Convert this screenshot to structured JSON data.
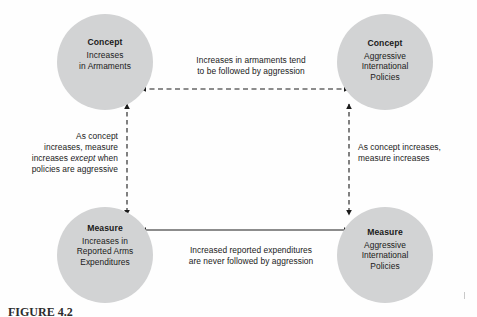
{
  "figure": {
    "caption": "FIGURE 4.2",
    "background_color": "#fefefe",
    "node_fill_color": "#d2d3d4",
    "line_color": "#1a1a1a"
  },
  "nodes": [
    {
      "id": "top-left",
      "title": "Concept",
      "lines": [
        "Increases",
        "in Armaments"
      ]
    },
    {
      "id": "top-right",
      "title": "Concept",
      "lines": [
        "Aggressive",
        "International",
        "Policies"
      ]
    },
    {
      "id": "bottom-left",
      "title": "Measure",
      "lines": [
        "Increases in",
        "Reported Arms",
        "Expenditures"
      ]
    },
    {
      "id": "bottom-right",
      "title": "Measure",
      "lines": [
        "Aggressive",
        "International",
        "Policies"
      ]
    }
  ],
  "edges": [
    {
      "id": "top-edge",
      "style": "dashed",
      "arrowheads": "both",
      "orientation": "horizontal",
      "lines": [
        "Increases in armaments tend",
        "to be followed by aggression"
      ]
    },
    {
      "id": "bottom-edge",
      "style": "solid",
      "arrowheads": "both",
      "orientation": "horizontal",
      "lines": [
        "Increased reported expenditures",
        "are never followed by aggression"
      ]
    },
    {
      "id": "left-edge",
      "style": "dashed",
      "arrowheads": "both",
      "orientation": "vertical",
      "lines": [
        "As concept",
        "increases, measure",
        "increases except when",
        "policies are aggressive"
      ],
      "emphasis_word": "except"
    },
    {
      "id": "right-edge",
      "style": "dashed",
      "arrowheads": "both",
      "orientation": "vertical",
      "lines": [
        "As concept increases,",
        "measure increases"
      ]
    }
  ]
}
